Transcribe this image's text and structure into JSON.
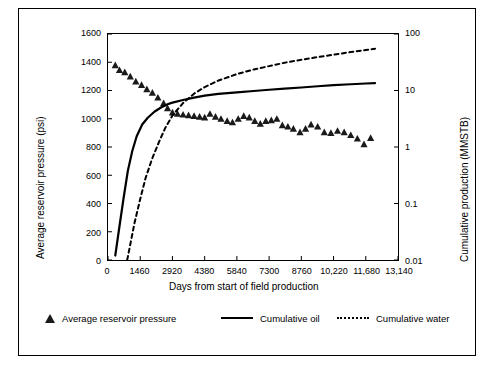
{
  "chart_data": {
    "type": "line",
    "title": "",
    "xlabel": "Days from start of field production",
    "ylabel_left": "Average reservoir pressure (psi)",
    "ylabel_right": "Cumulative production (MMSTB)",
    "xlim": [
      0,
      13140
    ],
    "xticks": [
      0,
      1460,
      2920,
      4380,
      5840,
      7300,
      8760,
      10220,
      11680,
      13140
    ],
    "xtick_labels": [
      "0",
      "1460",
      "2920",
      "4380",
      "5840",
      "7300",
      "8760",
      "10,220",
      "11,680",
      "13,140"
    ],
    "ylim_left": [
      0,
      1600
    ],
    "yticks_left": [
      0,
      200,
      400,
      600,
      800,
      1000,
      1200,
      1400,
      1600
    ],
    "ytick_labels_left": [
      "0",
      "200",
      "400",
      "600",
      "800",
      "1000",
      "1200",
      "1400",
      "1600"
    ],
    "ylim_right_log": [
      0.01,
      100
    ],
    "yticks_right": [
      0.01,
      0.1,
      1,
      10,
      100
    ],
    "ytick_labels_right": [
      "0.01",
      "0.1",
      "1",
      "10",
      "100"
    ],
    "grid": false,
    "legend_position": "bottom",
    "series": [
      {
        "name": "Average reservoir pressure",
        "type": "scatter",
        "axis": "left",
        "marker": "triangle",
        "color": "#1a1a1a",
        "points": [
          [
            330,
            1380
          ],
          [
            520,
            1345
          ],
          [
            760,
            1330
          ],
          [
            1010,
            1300
          ],
          [
            1260,
            1265
          ],
          [
            1520,
            1240
          ],
          [
            1760,
            1210
          ],
          [
            2010,
            1185
          ],
          [
            2260,
            1150
          ],
          [
            2520,
            1110
          ],
          [
            2700,
            1075
          ],
          [
            2920,
            1045
          ],
          [
            3150,
            1035
          ],
          [
            3400,
            1030
          ],
          [
            3650,
            1025
          ],
          [
            3900,
            1020
          ],
          [
            4150,
            1015
          ],
          [
            4380,
            1010
          ],
          [
            4620,
            1035
          ],
          [
            4870,
            1015
          ],
          [
            5120,
            1000
          ],
          [
            5400,
            985
          ],
          [
            5640,
            975
          ],
          [
            5900,
            1000
          ],
          [
            6150,
            1020
          ],
          [
            6400,
            1010
          ],
          [
            6650,
            985
          ],
          [
            6900,
            965
          ],
          [
            7150,
            985
          ],
          [
            7400,
            990
          ],
          [
            7650,
            1000
          ],
          [
            7900,
            955
          ],
          [
            8150,
            945
          ],
          [
            8400,
            930
          ],
          [
            8700,
            905
          ],
          [
            8950,
            930
          ],
          [
            9200,
            960
          ],
          [
            9500,
            945
          ],
          [
            9800,
            905
          ],
          [
            10100,
            900
          ],
          [
            10400,
            915
          ],
          [
            10700,
            905
          ],
          [
            11000,
            885
          ],
          [
            11300,
            860
          ],
          [
            11600,
            820
          ],
          [
            11900,
            865
          ]
        ]
      },
      {
        "name": "Cumulative oil",
        "type": "line",
        "axis": "right-log",
        "style": "solid",
        "color": "#000000",
        "points": [
          [
            330,
            0.012
          ],
          [
            500,
            0.035
          ],
          [
            700,
            0.12
          ],
          [
            900,
            0.38
          ],
          [
            1100,
            0.85
          ],
          [
            1300,
            1.55
          ],
          [
            1550,
            2.5
          ],
          [
            1800,
            3.3
          ],
          [
            2100,
            4.2
          ],
          [
            2400,
            5.0
          ],
          [
            2700,
            5.7
          ],
          [
            2920,
            6.1
          ],
          [
            3400,
            6.8
          ],
          [
            3900,
            7.5
          ],
          [
            4380,
            8.1
          ],
          [
            5000,
            8.7
          ],
          [
            5840,
            9.3
          ],
          [
            6600,
            9.8
          ],
          [
            7300,
            10.3
          ],
          [
            8000,
            10.8
          ],
          [
            8760,
            11.3
          ],
          [
            9500,
            11.9
          ],
          [
            10220,
            12.4
          ],
          [
            11000,
            12.9
          ],
          [
            11680,
            13.3
          ],
          [
            12100,
            13.5
          ]
        ]
      },
      {
        "name": "Cumulative water",
        "type": "line",
        "axis": "right-log",
        "style": "dashed",
        "color": "#000000",
        "points": [
          [
            870,
            0.01
          ],
          [
            1000,
            0.018
          ],
          [
            1200,
            0.045
          ],
          [
            1460,
            0.12
          ],
          [
            1700,
            0.28
          ],
          [
            2000,
            0.62
          ],
          [
            2300,
            1.2
          ],
          [
            2600,
            2.2
          ],
          [
            2920,
            3.6
          ],
          [
            3400,
            6.0
          ],
          [
            3900,
            8.8
          ],
          [
            4380,
            11.5
          ],
          [
            5000,
            15.0
          ],
          [
            5840,
            19.5
          ],
          [
            6600,
            23.5
          ],
          [
            7300,
            27.0
          ],
          [
            8000,
            31.0
          ],
          [
            8760,
            35.0
          ],
          [
            9500,
            39.0
          ],
          [
            10220,
            43.0
          ],
          [
            11000,
            48.0
          ],
          [
            11680,
            52.0
          ],
          [
            12100,
            55.0
          ]
        ]
      }
    ],
    "legend": [
      {
        "label": "Average reservoir pressure",
        "marker": "triangle"
      },
      {
        "label": "Cumulative oil",
        "marker": "solid-line"
      },
      {
        "label": "Cumulative water",
        "marker": "dashed-line"
      }
    ]
  }
}
